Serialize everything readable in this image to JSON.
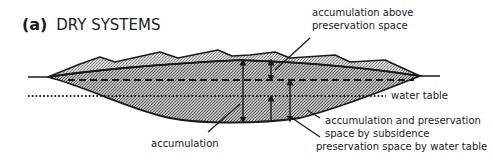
{
  "figure": {
    "panel_label": "(a)",
    "title": "DRY SYSTEMS"
  },
  "annotations": {
    "accumulation_above_line1": "accumulation above",
    "accumulation_above_line2": "preservation space",
    "water_table": "water table",
    "accumulation": "accumulation",
    "subsidence_line1": "accumulation and preservation",
    "subsidence_line2": "space by subsidence",
    "water_table_space": "preservation space by water table"
  },
  "colors": {
    "ink": "#1a1a1a",
    "fill_light": "#d9d9d9",
    "fill_dark": "#b0b0b0"
  }
}
